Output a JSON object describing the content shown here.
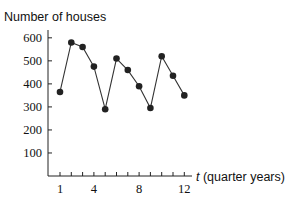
{
  "chart_data": {
    "type": "line",
    "title": "",
    "ylabel": "Number of houses",
    "xlabel_var": "t",
    "xlabel_rest": " (quarter years)",
    "xlabel": "t (quarter years)",
    "x": [
      1,
      2,
      3,
      4,
      5,
      6,
      7,
      8,
      9,
      10,
      11,
      12
    ],
    "values": [
      365,
      580,
      560,
      475,
      290,
      510,
      460,
      390,
      295,
      520,
      435,
      350
    ],
    "xticks_labeled": [
      1,
      4,
      8,
      12
    ],
    "yticks": [
      100,
      200,
      300,
      400,
      500,
      600
    ],
    "ylim": [
      0,
      640
    ],
    "xlim": [
      0,
      13
    ],
    "grid": false,
    "legend": null,
    "marker": "filled-circle",
    "line_color": "#333333",
    "marker_color": "#222222"
  }
}
